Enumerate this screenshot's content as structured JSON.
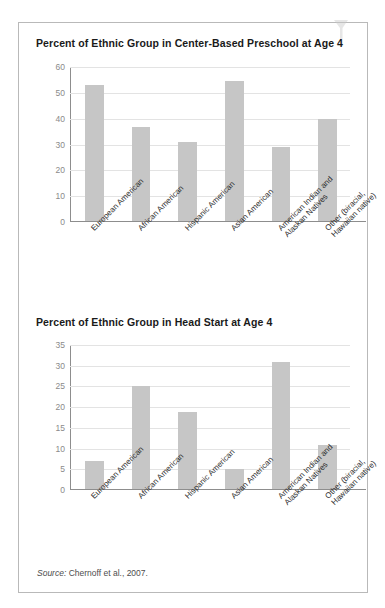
{
  "figure": {
    "source_prefix": "Source:",
    "source_text": "Chernoff et al., 2007.",
    "bar_color": "#c6c6c6",
    "grid_color": "#e3e3e3",
    "axis_color": "#8d8d8d",
    "border_color": "#b9b9b9"
  },
  "chart_data": [
    {
      "type": "bar",
      "title": "Percent of Ethnic Group in Center-Based Preschool at Age 4",
      "xlabel": "",
      "ylabel": "",
      "ylim": [
        0,
        60
      ],
      "yticks": [
        0,
        10,
        20,
        30,
        40,
        50,
        60
      ],
      "ytick_labels": [
        "0",
        "10",
        "20",
        "30",
        "40",
        "50",
        "60"
      ],
      "grid": true,
      "legend": "none",
      "categories": [
        "European American",
        "African American",
        "Hispanic American",
        "Asian American",
        "American Indian and\nAlaskan Natives",
        "Other (biracial,\nHawaiian native)"
      ],
      "values": [
        53,
        36.7,
        30.7,
        54.5,
        28.8,
        39.8
      ]
    },
    {
      "type": "bar",
      "title": "Percent of Ethnic Group in Head Start at Age 4",
      "xlabel": "",
      "ylabel": "",
      "ylim": [
        0,
        35
      ],
      "yticks": [
        0,
        5,
        10,
        15,
        20,
        25,
        30,
        35
      ],
      "ytick_labels": [
        "0",
        "5",
        "10",
        "15",
        "20",
        "25",
        "30",
        "35"
      ],
      "grid": true,
      "legend": "none",
      "categories": [
        "European American",
        "African American",
        "Hispanic American",
        "Asian American",
        "American Indian and\nAlaskan Natives",
        "Other (biracial,\nHawaiian native)"
      ],
      "values": [
        6.8,
        25,
        18.8,
        4.8,
        30.8,
        10.8
      ]
    }
  ]
}
